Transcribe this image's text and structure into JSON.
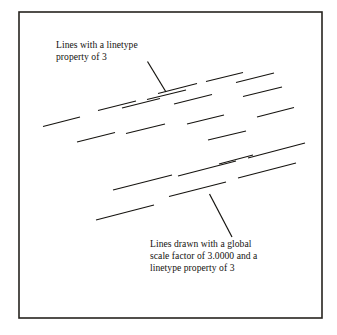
{
  "figure": {
    "kind": "cad-linetype-scale-illustration",
    "background_color": "#ffffff",
    "ink_color": "#15130f",
    "frame": {
      "name": "figure-border",
      "x": 19,
      "y": 12,
      "width": 303,
      "height": 306,
      "stroke_color": "#26231e",
      "stroke_width": 1.6
    }
  },
  "annotations": {
    "top": {
      "name": "upper-callout",
      "lines": [
        "Lines with a linetype",
        "property of 3"
      ],
      "leader": {
        "from_x": 147.5,
        "from_y": 61.5,
        "to_x": 166,
        "to_y": 92
      }
    },
    "bottom": {
      "name": "lower-callout",
      "lines": [
        "Lines drawn with a global",
        "scale factor of 3.0000 and a",
        "linetype property of 3"
      ],
      "leader": {
        "from_x": 209.5,
        "from_y": 194,
        "to_x": 232,
        "to_y": 237
      }
    }
  },
  "dash_groups": [
    {
      "name": "upper-dash-group",
      "description": "Lines with a linetype property of 3 (normal global scale)",
      "stroke_width": 1.15,
      "dashes": [
        {
          "x1": 158,
          "y1": 93.5,
          "x2": 197,
          "y2": 83.5
        },
        {
          "x1": 206,
          "y1": 81.5,
          "x2": 243,
          "y2": 72.5
        },
        {
          "x1": 98,
          "y1": 110.5,
          "x2": 136,
          "y2": 101
        },
        {
          "x1": 147,
          "y1": 99.5,
          "x2": 186,
          "y2": 90
        },
        {
          "x1": 236,
          "y1": 82.5,
          "x2": 274,
          "y2": 73
        },
        {
          "x1": 43,
          "y1": 126.5,
          "x2": 80,
          "y2": 117
        },
        {
          "x1": 122,
          "y1": 108,
          "x2": 160,
          "y2": 98.5
        },
        {
          "x1": 174,
          "y1": 104,
          "x2": 212,
          "y2": 94.5
        },
        {
          "x1": 243,
          "y1": 96.5,
          "x2": 282,
          "y2": 87
        },
        {
          "x1": 77,
          "y1": 142,
          "x2": 115,
          "y2": 132.5
        },
        {
          "x1": 126,
          "y1": 133.5,
          "x2": 165,
          "y2": 124
        },
        {
          "x1": 187,
          "y1": 124,
          "x2": 224,
          "y2": 115
        },
        {
          "x1": 257,
          "y1": 117,
          "x2": 294,
          "y2": 107.5
        },
        {
          "x1": 208,
          "y1": 140,
          "x2": 246,
          "y2": 131
        }
      ]
    },
    {
      "name": "lower-dash-group",
      "description": "Lines drawn with a global scale factor of 3.0000 and a linetype property of 3",
      "stroke_width": 1.15,
      "dashes": [
        {
          "x1": 113,
          "y1": 190,
          "x2": 172,
          "y2": 175
        },
        {
          "x1": 178,
          "y1": 176,
          "x2": 236,
          "y2": 161
        },
        {
          "x1": 248,
          "y1": 158,
          "x2": 305,
          "y2": 143
        },
        {
          "x1": 96,
          "y1": 220,
          "x2": 154,
          "y2": 205
        },
        {
          "x1": 169,
          "y1": 196.5,
          "x2": 226,
          "y2": 182
        },
        {
          "x1": 238,
          "y1": 178,
          "x2": 296,
          "y2": 163
        },
        {
          "x1": 219,
          "y1": 164,
          "x2": 253,
          "y2": 155
        }
      ]
    }
  ]
}
